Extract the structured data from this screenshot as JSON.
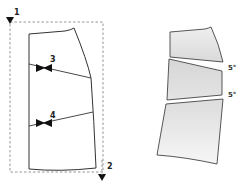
{
  "diagram": {
    "left_panel": {
      "markers": [
        {
          "id": "1",
          "label": "1",
          "position": "top-left"
        },
        {
          "id": "2",
          "label": "2",
          "position": "bottom-right"
        }
      ],
      "notches": [
        {
          "id": "3",
          "label": "3"
        },
        {
          "id": "4",
          "label": "4"
        }
      ]
    },
    "right_panel": {
      "angles": [
        {
          "label": "5°"
        },
        {
          "label": "5°"
        }
      ]
    },
    "colors": {
      "line": "#333333",
      "dashed": "#888888",
      "fill_top": "#e6e6e6",
      "fill_bottom": "#f4f4f4"
    }
  }
}
